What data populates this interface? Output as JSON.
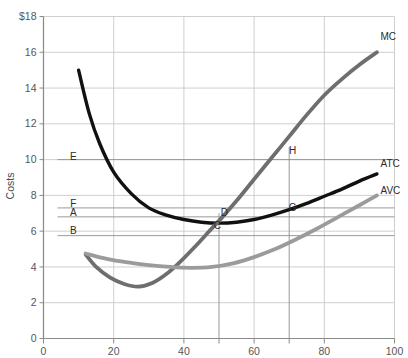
{
  "chart_data": {
    "type": "line",
    "title": "",
    "xlabel": "",
    "ylabel": "Costs",
    "xlim": [
      0,
      100
    ],
    "ylim": [
      0,
      18
    ],
    "grid": true,
    "legend_position": "inline-right-of-curve-ends",
    "y_ticks": [
      "$18",
      "16",
      "14",
      "12",
      "10",
      "8",
      "6",
      "4",
      "2",
      "0"
    ],
    "y_tick_values": [
      18,
      16,
      14,
      12,
      10,
      8,
      6,
      4,
      2,
      0
    ],
    "x_ticks": [
      "0",
      "20",
      "40",
      "60",
      "80",
      "100"
    ],
    "x_tick_values": [
      0,
      20,
      40,
      60,
      80,
      100
    ],
    "series": [
      {
        "name": "ATC",
        "label": "ATC",
        "color": "#111111",
        "width": 3.4,
        "points": [
          [
            10,
            15.0
          ],
          [
            13,
            12.6
          ],
          [
            16,
            10.9
          ],
          [
            20,
            9.3
          ],
          [
            25,
            8.1
          ],
          [
            30,
            7.3
          ],
          [
            35,
            6.9
          ],
          [
            40,
            6.65
          ],
          [
            45,
            6.5
          ],
          [
            50,
            6.45
          ],
          [
            55,
            6.5
          ],
          [
            60,
            6.65
          ],
          [
            65,
            6.9
          ],
          [
            70,
            7.2
          ],
          [
            75,
            7.55
          ],
          [
            80,
            7.95
          ],
          [
            85,
            8.35
          ],
          [
            90,
            8.8
          ],
          [
            95,
            9.2
          ]
        ]
      },
      {
        "name": "MC",
        "label": "MC",
        "color": "#6e6e6e",
        "width": 3.8,
        "points": [
          [
            12,
            4.7
          ],
          [
            15,
            4.0
          ],
          [
            19,
            3.4
          ],
          [
            23,
            3.05
          ],
          [
            27,
            2.9
          ],
          [
            31,
            3.1
          ],
          [
            35,
            3.6
          ],
          [
            39,
            4.3
          ],
          [
            43,
            5.1
          ],
          [
            47,
            5.95
          ],
          [
            51,
            6.8
          ],
          [
            55,
            7.7
          ],
          [
            60,
            8.9
          ],
          [
            65,
            10.1
          ],
          [
            70,
            11.3
          ],
          [
            75,
            12.5
          ],
          [
            80,
            13.6
          ],
          [
            85,
            14.5
          ],
          [
            90,
            15.3
          ],
          [
            95,
            16.0
          ]
        ]
      },
      {
        "name": "AVC",
        "label": "AVC",
        "color": "#9b9b9b",
        "width": 3.8,
        "points": [
          [
            12,
            4.75
          ],
          [
            18,
            4.45
          ],
          [
            24,
            4.25
          ],
          [
            30,
            4.1
          ],
          [
            36,
            4.0
          ],
          [
            42,
            3.95
          ],
          [
            48,
            4.0
          ],
          [
            54,
            4.2
          ],
          [
            60,
            4.55
          ],
          [
            66,
            5.0
          ],
          [
            72,
            5.55
          ],
          [
            78,
            6.15
          ],
          [
            84,
            6.8
          ],
          [
            90,
            7.45
          ],
          [
            95,
            8.0
          ]
        ]
      }
    ],
    "point_labels": [
      {
        "name": "E",
        "x": 8.5,
        "y": 10.0
      },
      {
        "name": "F",
        "x": 8.5,
        "y": 7.35
      },
      {
        "name": "A",
        "x": 8.5,
        "y": 6.85
      },
      {
        "name": "B",
        "x": 8.5,
        "y": 5.85
      },
      {
        "name": "C",
        "x": 49.5,
        "y": 6.1
      },
      {
        "name": "D",
        "x": 51.5,
        "y": 6.85
      },
      {
        "name": "G",
        "x": 71.0,
        "y": 7.1
      },
      {
        "name": "H",
        "x": 71.0,
        "y": 10.3
      }
    ],
    "reference_lines": {
      "horizontal": [
        {
          "label": "E",
          "y": 10.0,
          "x_from": 4,
          "x_to": 100
        },
        {
          "label": "F",
          "y": 7.3,
          "x_from": 4,
          "x_to": 100
        },
        {
          "label": "A",
          "y": 6.8,
          "x_from": 4,
          "x_to": 100
        },
        {
          "label": "B",
          "y": 5.75,
          "x_from": 4,
          "x_to": 100
        }
      ],
      "vertical": [
        {
          "label": "C-D",
          "x": 50,
          "y_from": 0,
          "y_to": 7.0
        },
        {
          "label": "G-H",
          "x": 70,
          "y_from": 0,
          "y_to": 10.7
        }
      ]
    },
    "curve_end_labels": [
      {
        "name": "MC",
        "x": 96,
        "y": 16.7
      },
      {
        "name": "ATC",
        "x": 96,
        "y": 9.6
      },
      {
        "name": "AVC",
        "x": 96,
        "y": 8.1
      }
    ],
    "colors": {
      "grid": "#c9c9c9",
      "axis": "#8a8a8a",
      "atc": "#111111",
      "mc": "#6e6e6e",
      "avc": "#9b9b9b",
      "text": "#3a3a3a",
      "background": "#ffffff"
    }
  }
}
